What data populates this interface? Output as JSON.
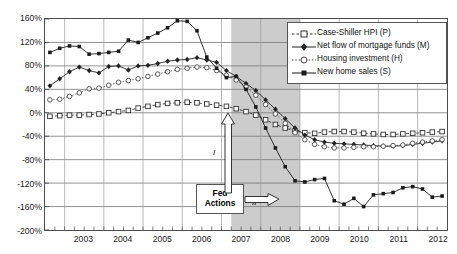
{
  "chart_data": {
    "type": "line",
    "title": "",
    "xlabel": "",
    "ylabel": "",
    "ylim": [
      -200,
      160
    ],
    "xlim": [
      2002.5,
      2012.75
    ],
    "grid": true,
    "legend_position": "top-right",
    "yticks": [
      "160%",
      "120%",
      "80%",
      "40%",
      "0%",
      "-40%",
      "-80%",
      "-120%",
      "-160%",
      "-200%"
    ],
    "ytick_values": [
      160,
      120,
      80,
      40,
      0,
      -40,
      -80,
      -120,
      -160,
      -200
    ],
    "xticks": [
      "2003",
      "2004",
      "2005",
      "2006",
      "2007",
      "2008",
      "2009",
      "2010",
      "2011",
      "2012"
    ],
    "xtick_values": [
      2003,
      2004,
      2005,
      2006,
      2007,
      2008,
      2009,
      2010,
      2011,
      2012
    ],
    "x": [
      2002.625,
      2002.875,
      2003.125,
      2003.375,
      2003.625,
      2003.875,
      2004.125,
      2004.375,
      2004.625,
      2004.875,
      2005.125,
      2005.375,
      2005.625,
      2005.875,
      2006.125,
      2006.375,
      2006.625,
      2006.875,
      2007.125,
      2007.375,
      2007.625,
      2007.875,
      2008.125,
      2008.375,
      2008.625,
      2008.875,
      2009.125,
      2009.375,
      2009.625,
      2009.875,
      2010.125,
      2010.375,
      2010.625,
      2010.875,
      2011.125,
      2011.375,
      2011.625,
      2011.875,
      2012.125,
      2012.375,
      2012.625
    ],
    "series": [
      {
        "name": "Case-Shiller HPI (P)",
        "code": "P",
        "marker": "open-square",
        "line": "dashed",
        "color": "#333333",
        "values": [
          -6,
          -5,
          -4,
          -4,
          -3,
          -2,
          0,
          2,
          4,
          8,
          11,
          14,
          16,
          17,
          18,
          17,
          15,
          13,
          11,
          7,
          2,
          -4,
          -12,
          -20,
          -26,
          -31,
          -34,
          -35,
          -33,
          -32,
          -32,
          -33,
          -35,
          -36,
          -37,
          -37,
          -36,
          -35,
          -34,
          -33,
          -32
        ]
      },
      {
        "name": "Net flow of mortgage funds (M)",
        "code": "M",
        "marker": "filled-diamond",
        "line": "solid",
        "color": "#222222",
        "values": [
          46,
          58,
          70,
          78,
          72,
          68,
          79,
          80,
          73,
          80,
          81,
          84,
          88,
          90,
          91,
          94,
          90,
          86,
          72,
          62,
          50,
          38,
          22,
          6,
          -10,
          -26,
          -38,
          -46,
          -50,
          -52,
          -53,
          -54,
          -55,
          -56,
          -57,
          -57,
          -56,
          -54,
          -52,
          -50,
          -48
        ]
      },
      {
        "name": "Housing investment (H)",
        "code": "H",
        "marker": "open-circle",
        "line": "dotted",
        "color": "#444444",
        "values": [
          22,
          23,
          28,
          34,
          41,
          42,
          47,
          52,
          55,
          58,
          62,
          66,
          70,
          74,
          76,
          78,
          77,
          72,
          64,
          56,
          44,
          30,
          14,
          -2,
          -18,
          -34,
          -46,
          -54,
          -58,
          -60,
          -60,
          -59,
          -58,
          -58,
          -57,
          -56,
          -55,
          -52,
          -50,
          -48,
          -46
        ]
      },
      {
        "name": "New home sales (S)",
        "code": "S",
        "marker": "filled-square",
        "line": "solid",
        "color": "#1a1a1a",
        "values": [
          103,
          110,
          114,
          113,
          100,
          101,
          103,
          105,
          124,
          120,
          128,
          136,
          145,
          157,
          156,
          140,
          95,
          76,
          60,
          62,
          40,
          10,
          -26,
          -60,
          -92,
          -116,
          -118,
          -114,
          -112,
          -150,
          -156,
          -146,
          -160,
          -140,
          -138,
          -136,
          -128,
          -126,
          -130,
          -144,
          -142
        ]
      }
    ],
    "shaded_bands": [
      {
        "name": "recession",
        "from": 2007.25,
        "to": 2009.0,
        "color": "#cccccc"
      }
    ],
    "annotations": [
      {
        "name": "fed-actions-box",
        "text_line1": "Fed",
        "text_line2": "Actions"
      },
      {
        "name": "arrow-i",
        "label": "I",
        "direction": "up"
      },
      {
        "name": "arrow-ii",
        "label": "II",
        "direction": "right"
      }
    ]
  },
  "legend": {
    "items": [
      {
        "label": "Case-Shiller HPI (P)",
        "marker": "open-square-dashed-icon"
      },
      {
        "label": "Net flow of mortgage funds (M)",
        "marker": "filled-diamond-solid-icon"
      },
      {
        "label": "Housing investment (H)",
        "marker": "open-circle-dotted-icon"
      },
      {
        "label": "New home sales (S)",
        "marker": "filled-square-solid-icon"
      }
    ]
  },
  "fed_box": {
    "line1": "Fed",
    "line2": "Actions"
  },
  "arrows": {
    "vertical_label": "I",
    "horizontal_label": "II"
  }
}
